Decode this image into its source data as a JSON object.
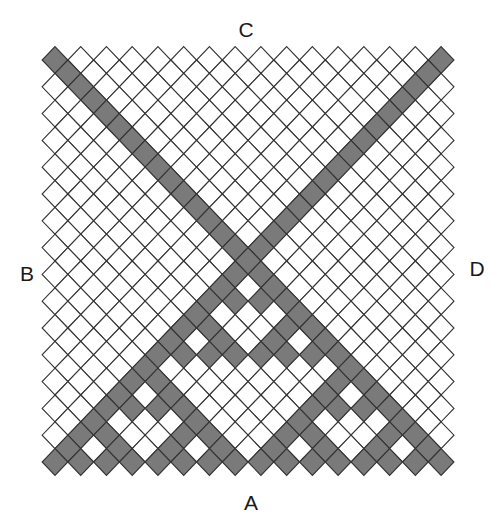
{
  "diagram": {
    "type": "diamond-lattice",
    "labels": {
      "top": "C",
      "bottom": "A",
      "left": "B",
      "right": "D"
    },
    "label_positions": {
      "top": [
        246,
        29
      ],
      "bottom": [
        251,
        502
      ],
      "left": [
        27,
        273
      ],
      "right": [
        477,
        268
      ]
    },
    "grid": {
      "origin_x": 55,
      "origin_y": 60,
      "half_step_x": 12.87,
      "half_step_y": 13.4,
      "rows": 31,
      "positions": 31,
      "diamonds_per_even_row": 16,
      "diamonds_per_odd_row": 15
    },
    "pattern": {
      "diagonal_bands": [
        "top-left to bottom-right",
        "top-right to bottom-left"
      ],
      "apex_row": 15,
      "apex_position": 15,
      "lower_triangle_rule": "shaded if binomial(n, m) is odd"
    },
    "colors": {
      "shaded_fill": "#7a7a7a",
      "empty_fill": "#ffffff",
      "stroke": "#333333",
      "background": "#ffffff"
    }
  }
}
